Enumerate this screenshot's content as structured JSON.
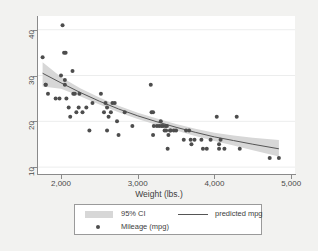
{
  "chart_data": {
    "type": "scatter",
    "title": "",
    "xlabel": "Weight (lbs.)",
    "ylabel": "",
    "xlim": [
      1700,
      5050
    ],
    "ylim": [
      8.5,
      43
    ],
    "grid": true,
    "grid_axis": "y",
    "legend_position": "bottom",
    "xticks": [
      2000,
      3000,
      4000,
      5000
    ],
    "xticklabels": [
      "2,000",
      "3,000",
      "4,000",
      "5,000"
    ],
    "yticks": [
      10,
      20,
      30,
      40
    ],
    "yticklabels": [
      "10",
      "20",
      "30",
      "40"
    ],
    "colors": {
      "marker": "#4d4d4d",
      "fit_line": "#555555",
      "ci_band": "#d7d7d7",
      "axis": "#8a8a8a",
      "grid": "#eceded",
      "plot_background": "#ffffff",
      "page_background": "#f2f2f0",
      "legend_border": "#9a9a9a",
      "text": "#3d3d3d"
    },
    "legend": [
      {
        "key": "ci-band",
        "label": "95% CI"
      },
      {
        "key": "fit-line",
        "label": "predicted mpg"
      },
      {
        "key": "marker",
        "label": "Mileage (mpg)"
      }
    ],
    "series": [
      {
        "name": "Mileage (mpg)",
        "type": "scatter",
        "points": [
          [
            1760,
            34
          ],
          [
            1800,
            28
          ],
          [
            1800,
            28
          ],
          [
            1830,
            26
          ],
          [
            1930,
            25
          ],
          [
            1980,
            25
          ],
          [
            2000,
            30
          ],
          [
            2020,
            41
          ],
          [
            2040,
            35
          ],
          [
            2060,
            35
          ],
          [
            2050,
            29
          ],
          [
            2050,
            28
          ],
          [
            2070,
            25
          ],
          [
            2100,
            23
          ],
          [
            2120,
            21
          ],
          [
            2150,
            31
          ],
          [
            2160,
            26
          ],
          [
            2180,
            26
          ],
          [
            2200,
            22
          ],
          [
            2230,
            23
          ],
          [
            2240,
            26
          ],
          [
            2280,
            22
          ],
          [
            2330,
            23
          ],
          [
            2370,
            18
          ],
          [
            2410,
            24
          ],
          [
            2520,
            26
          ],
          [
            2560,
            22
          ],
          [
            2580,
            24
          ],
          [
            2600,
            23
          ],
          [
            2600,
            18
          ],
          [
            2620,
            21
          ],
          [
            2650,
            22
          ],
          [
            2670,
            24
          ],
          [
            2700,
            24
          ],
          [
            2730,
            20
          ],
          [
            2750,
            17
          ],
          [
            2830,
            22
          ],
          [
            2930,
            19
          ],
          [
            3170,
            28
          ],
          [
            3180,
            22
          ],
          [
            3200,
            22
          ],
          [
            3200,
            17
          ],
          [
            3210,
            19
          ],
          [
            3250,
            19
          ],
          [
            3280,
            19
          ],
          [
            3300,
            20
          ],
          [
            3310,
            19
          ],
          [
            3330,
            19
          ],
          [
            3350,
            18
          ],
          [
            3360,
            19
          ],
          [
            3370,
            18
          ],
          [
            3380,
            19
          ],
          [
            3390,
            14
          ],
          [
            3400,
            17
          ],
          [
            3420,
            18
          ],
          [
            3430,
            18
          ],
          [
            3470,
            18
          ],
          [
            3500,
            18
          ],
          [
            3600,
            16
          ],
          [
            3630,
            18
          ],
          [
            3670,
            18
          ],
          [
            3690,
            16
          ],
          [
            3700,
            15
          ],
          [
            3740,
            16
          ],
          [
            3830,
            16
          ],
          [
            3850,
            14
          ],
          [
            3900,
            14
          ],
          [
            3950,
            16
          ],
          [
            4030,
            21
          ],
          [
            4060,
            15
          ],
          [
            4060,
            14
          ],
          [
            4080,
            16
          ],
          [
            4130,
            14
          ],
          [
            4290,
            21
          ],
          [
            4330,
            14
          ],
          [
            4720,
            12
          ],
          [
            4840,
            12
          ]
        ]
      },
      {
        "name": "predicted mpg",
        "type": "line",
        "points": [
          [
            1760,
            30.5
          ],
          [
            2000,
            28.4
          ],
          [
            2250,
            26.3
          ],
          [
            2500,
            24.4
          ],
          [
            2750,
            22.7
          ],
          [
            3000,
            21.2
          ],
          [
            3250,
            19.9
          ],
          [
            3500,
            18.7
          ],
          [
            3750,
            17.6
          ],
          [
            4000,
            16.6
          ],
          [
            4250,
            15.8
          ],
          [
            4500,
            15.0
          ],
          [
            4840,
            14.0
          ]
        ]
      },
      {
        "name": "95% CI",
        "type": "band",
        "upper": [
          [
            1760,
            32.9
          ],
          [
            2000,
            29.7
          ],
          [
            2250,
            27.2
          ],
          [
            2500,
            25.2
          ],
          [
            2750,
            23.4
          ],
          [
            3000,
            21.9
          ],
          [
            3250,
            20.6
          ],
          [
            3500,
            19.4
          ],
          [
            3750,
            18.4
          ],
          [
            4000,
            17.5
          ],
          [
            4250,
            16.9
          ],
          [
            4500,
            16.4
          ],
          [
            4840,
            15.9
          ]
        ],
        "lower": [
          [
            1760,
            27.6
          ],
          [
            2000,
            27.1
          ],
          [
            2250,
            25.5
          ],
          [
            2500,
            23.7
          ],
          [
            2750,
            22.0
          ],
          [
            3000,
            20.5
          ],
          [
            3250,
            19.2
          ],
          [
            3500,
            18.0
          ],
          [
            3750,
            16.8
          ],
          [
            4000,
            15.7
          ],
          [
            4250,
            14.7
          ],
          [
            4500,
            13.7
          ],
          [
            4840,
            12.3
          ]
        ]
      }
    ]
  }
}
